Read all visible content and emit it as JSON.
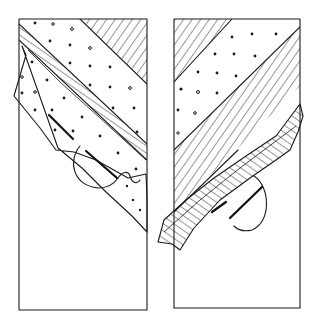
{
  "figure": {
    "panels": [
      {
        "id": "left",
        "label": ""
      },
      {
        "id": "right",
        "label": ""
      }
    ],
    "colors": {
      "ink": "#1a1a1a",
      "background": "#ffffff"
    }
  }
}
